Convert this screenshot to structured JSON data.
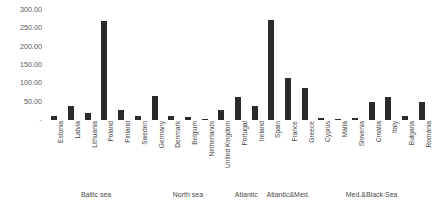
{
  "chart_data": {
    "type": "bar",
    "title": "",
    "xlabel": "",
    "ylabel": "",
    "ylim": [
      0,
      300
    ],
    "grid": false,
    "legend": "none",
    "bar_color": "#2b2b2b",
    "y_ticks": [
      "300.00",
      "250.00",
      "200.00",
      "150.00",
      "100.00",
      "50.00"
    ],
    "y_tick_values": [
      300,
      250,
      200,
      150,
      100,
      50
    ],
    "y_zero_label": "-",
    "categories": [
      "Estonia",
      "Latvia",
      "Lithuania",
      "Poland",
      "Finland",
      "Sweden",
      "Germany",
      "Denmark",
      "Belgium",
      "Netherlands",
      "United Kingdom",
      "Portugal",
      "Ireland",
      "Spain",
      "France",
      "Greece",
      "Cyprus",
      "Malta",
      "Slovenia",
      "Croatia",
      "Italy",
      "Bulgaria",
      "Romania"
    ],
    "values": [
      12,
      38,
      20,
      270,
      28,
      12,
      65,
      10,
      9,
      4,
      28,
      64,
      37,
      272,
      115,
      88,
      6,
      2,
      6,
      50,
      62,
      12,
      48
    ],
    "groups": [
      {
        "label": "Baltic sea",
        "start": 0,
        "end": 5
      },
      {
        "label": "North sea",
        "start": 6,
        "end": 10
      },
      {
        "label": "Atlantic",
        "start": 11,
        "end": 12
      },
      {
        "label": "Atlantic&Med.",
        "start": 13,
        "end": 15
      },
      {
        "label": "Med.&Black Sea",
        "start": 16,
        "end": 22
      }
    ]
  }
}
